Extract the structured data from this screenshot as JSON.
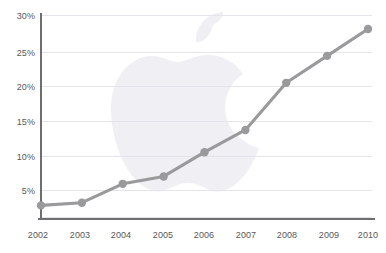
{
  "chart_data": {
    "type": "line",
    "title": "",
    "subtitle": "",
    "xlabel": "",
    "ylabel": "",
    "categories": [
      "2002",
      "2003",
      "2004",
      "2005",
      "2006",
      "2007",
      "2008",
      "2009",
      "2010"
    ],
    "x": [
      2002,
      2003,
      2004,
      2005,
      2006,
      2007,
      2008,
      2009,
      2010
    ],
    "values": [
      1.8,
      2.2,
      5.0,
      6.1,
      9.7,
      13.0,
      20.0,
      24.0,
      28.0
    ],
    "series": [
      {
        "name": "",
        "values": [
          1.8,
          2.2,
          5.0,
          6.1,
          9.7,
          13.0,
          20.0,
          24.0,
          28.0
        ]
      }
    ],
    "ylim": [
      0,
      30
    ],
    "xlim": [
      2002,
      2010
    ],
    "y_ticks": [
      5,
      10,
      15,
      20,
      25,
      30
    ],
    "y_tick_labels": [
      "5%",
      "10%",
      "15%",
      "20%",
      "25%",
      "30%"
    ],
    "x_tick_labels": [
      "2002",
      "2003",
      "2004",
      "2005",
      "2006",
      "2007",
      "2008",
      "2009",
      "2010"
    ],
    "grid": true,
    "grid_axis": "y",
    "legend": false,
    "legend_position": "none",
    "annotations": [],
    "watermark": "apple-logo",
    "colors": {
      "line": "#9a9a9c",
      "marker": "#9a9a9c",
      "gridline": "#e3e4ec",
      "axis": "#6e6e70",
      "tick_label": "#58585a",
      "background": "#ffffff",
      "watermark": "#f0eff4"
    }
  }
}
